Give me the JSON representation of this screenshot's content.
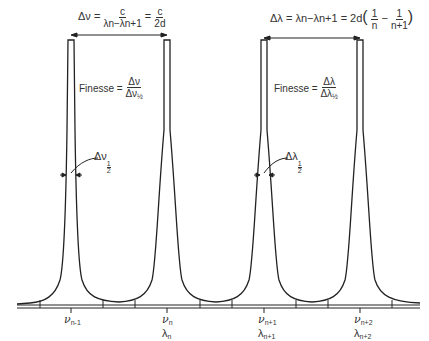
{
  "diagram": {
    "type": "lorentzian-peak-train",
    "colors": {
      "line": "#222222",
      "background": "#ffffff",
      "text": "#333333"
    },
    "peaks": [
      {
        "x": 71,
        "nu_label": "ν",
        "nu_sub": "n-1",
        "lambda_label": "",
        "lambda_sub": ""
      },
      {
        "x": 167,
        "nu_label": "ν",
        "nu_sub": "n",
        "lambda_label": "λ",
        "lambda_sub": "n"
      },
      {
        "x": 264,
        "nu_label": "ν",
        "nu_sub": "n+1",
        "lambda_label": "λ",
        "lambda_sub": "n+1"
      },
      {
        "x": 360,
        "nu_label": "ν",
        "nu_sub": "n+2",
        "lambda_label": "λ",
        "lambda_sub": "n+2"
      }
    ],
    "equation_left": {
      "lhs": "Δν =",
      "frac1_num": "c",
      "frac1_den": "λn−λn+1",
      "eq": "=",
      "frac2_num": "c",
      "frac2_den": "2d"
    },
    "equation_right": {
      "lhs": "Δλ = λn−λn+1 = 2d",
      "frac1_num": "1",
      "frac1_den": "n",
      "minus": "−",
      "frac2_num": "1",
      "frac2_den": "n+1"
    },
    "finesse_left": {
      "label": "Finesse =",
      "num": "Δν",
      "den": "Δν",
      "den_sub": "½"
    },
    "finesse_right": {
      "label": "Finesse =",
      "num": "Δλ",
      "den": "Δλ",
      "den_sub": "½"
    },
    "halfwidth_left": {
      "symbol": "Δν",
      "half_num": "1",
      "half_den": "2"
    },
    "halfwidth_right": {
      "symbol": "Δλ",
      "half_num": "1",
      "half_den": "2"
    },
    "labels": {
      "nu_n_minus_1": "n-1",
      "nu_n": "n",
      "nu_n_plus_1": "n+1",
      "nu_n_plus_2": "n+2",
      "lambda_n": "n",
      "lambda_n_plus_1": "n+1",
      "lambda_n_plus_2": "n+2",
      "nu": "ν",
      "lambda": "λ"
    }
  }
}
